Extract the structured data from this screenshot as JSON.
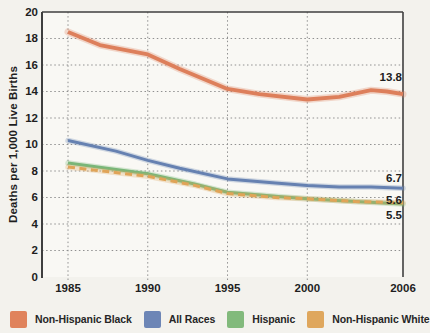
{
  "chart_data": {
    "type": "line",
    "title": "",
    "ylabel": "Deaths per 1,000 Live Births",
    "xlabel": "",
    "ylim": [
      0,
      20
    ],
    "xlim": [
      1985,
      2006
    ],
    "y_ticks": [
      20,
      18,
      16,
      14,
      12,
      10,
      8,
      6,
      4,
      2,
      0
    ],
    "x_ticks": [
      1985,
      1990,
      1995,
      2000,
      2006
    ],
    "grid": "dotted",
    "legend_position": "bottom",
    "series": [
      {
        "name": "Non-Hispanic Black",
        "color": "#dd7f5b",
        "swatch_color": "#e0835c",
        "dashed": false,
        "end_label": "13.8",
        "end_label_dy": -17,
        "points": [
          [
            1985,
            18.5
          ],
          [
            1987,
            17.5
          ],
          [
            1990,
            16.8
          ],
          [
            1992,
            15.7
          ],
          [
            1995,
            14.2
          ],
          [
            1997,
            13.8
          ],
          [
            2000,
            13.4
          ],
          [
            2002,
            13.6
          ],
          [
            2004,
            14.1
          ],
          [
            2005,
            14.0
          ],
          [
            2006,
            13.8
          ]
        ]
      },
      {
        "name": "All Races",
        "color": "#6681b1",
        "swatch_color": "#6d86b6",
        "dashed": false,
        "end_label": "6.7",
        "end_label_dy": -10,
        "points": [
          [
            1985,
            10.3
          ],
          [
            1988,
            9.5
          ],
          [
            1990,
            8.8
          ],
          [
            1992,
            8.2
          ],
          [
            1995,
            7.4
          ],
          [
            1998,
            7.1
          ],
          [
            2000,
            6.9
          ],
          [
            2002,
            6.8
          ],
          [
            2004,
            6.8
          ],
          [
            2006,
            6.7
          ]
        ]
      },
      {
        "name": "Hispanic",
        "color": "#79b678",
        "swatch_color": "#82ba7c",
        "dashed": false,
        "end_label": "5.5",
        "end_label_dy": 11,
        "points": [
          [
            1985,
            8.6
          ],
          [
            1990,
            7.8
          ],
          [
            1993,
            7.0
          ],
          [
            1995,
            6.4
          ],
          [
            1998,
            6.1
          ],
          [
            2000,
            5.9
          ],
          [
            2003,
            5.7
          ],
          [
            2006,
            5.5
          ]
        ]
      },
      {
        "name": "Non-Hispanic White",
        "color": "#e0a458",
        "swatch_color": "#dfa75d",
        "dashed": true,
        "end_label": "5.6",
        "end_label_dy": -2,
        "points": [
          [
            1985,
            8.3
          ],
          [
            1990,
            7.6
          ],
          [
            1993,
            6.9
          ],
          [
            1995,
            6.3
          ],
          [
            1998,
            6.0
          ],
          [
            2000,
            5.9
          ],
          [
            2003,
            5.7
          ],
          [
            2006,
            5.6
          ]
        ]
      }
    ]
  },
  "style_colors": {
    "axis": "#3f3f3f",
    "grid": "#909090",
    "text": "#1e1e1e",
    "plot_background": "#f9f8f4",
    "page_background": "#f3f2ed"
  }
}
